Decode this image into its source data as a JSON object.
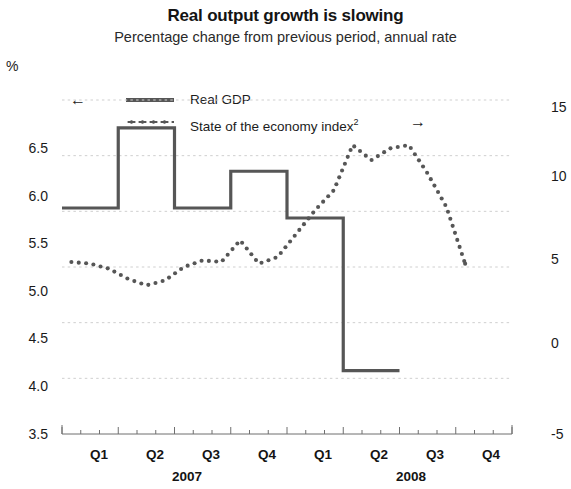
{
  "header": {
    "title": "Real output growth is slowing",
    "subtitle": "Percentage change from previous period, annual rate",
    "unit_label": "%"
  },
  "legend": {
    "left_arrow": "←",
    "right_arrow": "→",
    "series1_label": "Real GDP",
    "series2_label_text": "State of the economy index",
    "series2_superscript": "2"
  },
  "axes": {
    "left_ticks": [
      "6.5",
      "6.0",
      "5.5",
      "5.0",
      "4.5",
      "4.0",
      "3.5"
    ],
    "right_ticks": [
      "15",
      "10",
      "5",
      "0",
      "-5"
    ],
    "right_ticks_clipped": [
      "1",
      "1",
      "5",
      "0",
      "-5"
    ],
    "quarters": [
      "Q1",
      "Q2",
      "Q3",
      "Q4",
      "Q1",
      "Q2",
      "Q3",
      "Q4"
    ],
    "years": [
      "2007",
      "2008"
    ]
  },
  "colors": {
    "line": "#565656",
    "grid": "#cfcfcf",
    "axis": "#6f6f6f",
    "text": "#1a1a1a"
  },
  "chart_data": {
    "type": "line",
    "title": "Real output growth is slowing",
    "subtitle": "Percentage change from previous period, annual rate",
    "xlabel": "",
    "ylabel": "%",
    "grid": true,
    "legend_position": "top-left",
    "x_categories": [
      "Q1 2007",
      "Q2 2007",
      "Q3 2007",
      "Q4 2007",
      "Q1 2008",
      "Q2 2008",
      "Q3 2008",
      "Q4 2008"
    ],
    "left_axis": {
      "label": "%",
      "ylim": [
        3.5,
        6.5
      ],
      "ticks": [
        3.5,
        4.0,
        4.5,
        5.0,
        5.5,
        6.0,
        6.5
      ]
    },
    "right_axis": {
      "label": "",
      "ylim": [
        -5,
        15
      ],
      "ticks": [
        -5,
        0,
        5,
        10,
        15
      ]
    },
    "series": [
      {
        "name": "Real GDP",
        "axis": "left",
        "style": "step",
        "line": "solid",
        "arrow": "left",
        "step_values": [
          5.53,
          6.25,
          5.53,
          5.86,
          5.44,
          4.07
        ],
        "step_quarters": [
          "Q1 2007",
          "Q2 2007",
          "Q3 2007",
          "Q4 2007",
          "Q1 2008",
          "Q2 2008"
        ],
        "note": "quarterly step line; ends mid Q3 2008"
      },
      {
        "name": "State of the economy index2",
        "axis": "right",
        "style": "dotted",
        "line": "dotted",
        "arrow": "right",
        "x_monthly": [
          "2007-01",
          "2007-02",
          "2007-03",
          "2007-04",
          "2007-05",
          "2007-06",
          "2007-07",
          "2007-08",
          "2007-09",
          "2007-10",
          "2007-11",
          "2007-12",
          "2008-01",
          "2008-02",
          "2008-03",
          "2008-04",
          "2008-05",
          "2008-06",
          "2008-07",
          "2008-08",
          "2008-09",
          "2008-10"
        ],
        "values": [
          5.3,
          5.2,
          4.9,
          4.3,
          3.9,
          4.2,
          5.0,
          5.4,
          5.3,
          6.6,
          5.2,
          5.6,
          7.0,
          8.4,
          9.6,
          12.3,
          11.4,
          12.1,
          12.3,
          10.6,
          8.6,
          5.2
        ],
        "note": "monthly dotted series plotted on right-hand scale; declines sharply through 2008 to about -3 by late 2008"
      }
    ]
  }
}
